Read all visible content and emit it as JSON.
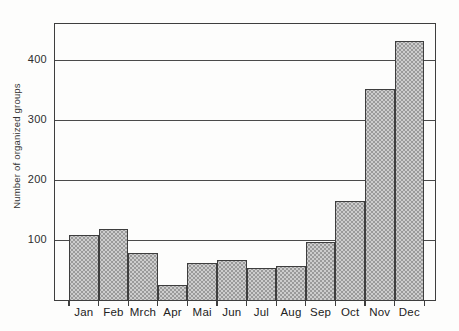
{
  "figure": {
    "background": "#fdfdfc",
    "kind": "scanned-statistical-bar-chart"
  },
  "chart_data": {
    "type": "bar",
    "categories": [
      "Jan",
      "Feb",
      "Mrch",
      "Apr",
      "Mai",
      "Jun",
      "Jul",
      "Aug",
      "Sep",
      "Oct",
      "Nov",
      "Dec"
    ],
    "values": [
      108,
      118,
      79,
      25,
      62,
      66,
      54,
      56,
      97,
      165,
      351,
      431
    ],
    "title": "",
    "xlabel": "",
    "ylabel": "Number of organized groups",
    "ylim": [
      0,
      460
    ],
    "yticks": [
      100,
      200,
      300,
      400
    ],
    "grid": "horizontal",
    "legend": "none",
    "bar_fill": "#cdcdcd",
    "bar_dot": "#9a9a9a",
    "bar_edge": "#3e3e3e",
    "axis_color": "#3e3e3e",
    "gridline_color": "#4a4a4a"
  }
}
